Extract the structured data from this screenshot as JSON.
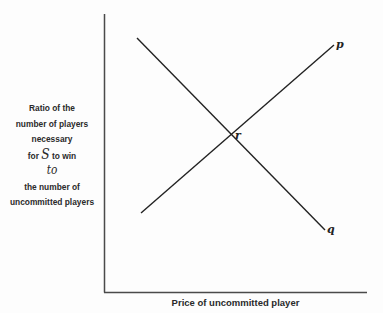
{
  "diagram": {
    "y_axis_label": {
      "line1": "Ratio of the",
      "line2": "number of players",
      "line3": "necessary",
      "line4_prefix": "for",
      "line4_symbol": "S",
      "line4_suffix": "to win",
      "line5": "to",
      "line6": "the number of",
      "line7": "uncommitted players"
    },
    "x_axis_label": "Price of uncommitted player",
    "lines": [
      {
        "label": "p",
        "from": [
          141,
          213
        ],
        "to": [
          334,
          45
        ]
      },
      {
        "label": "q",
        "from": [
          137,
          38
        ],
        "to": [
          325,
          230
        ]
      }
    ],
    "intersection_label": "r",
    "colors": {
      "axis": "#444444",
      "line": "#222222",
      "background": "#fdfdfd"
    }
  }
}
